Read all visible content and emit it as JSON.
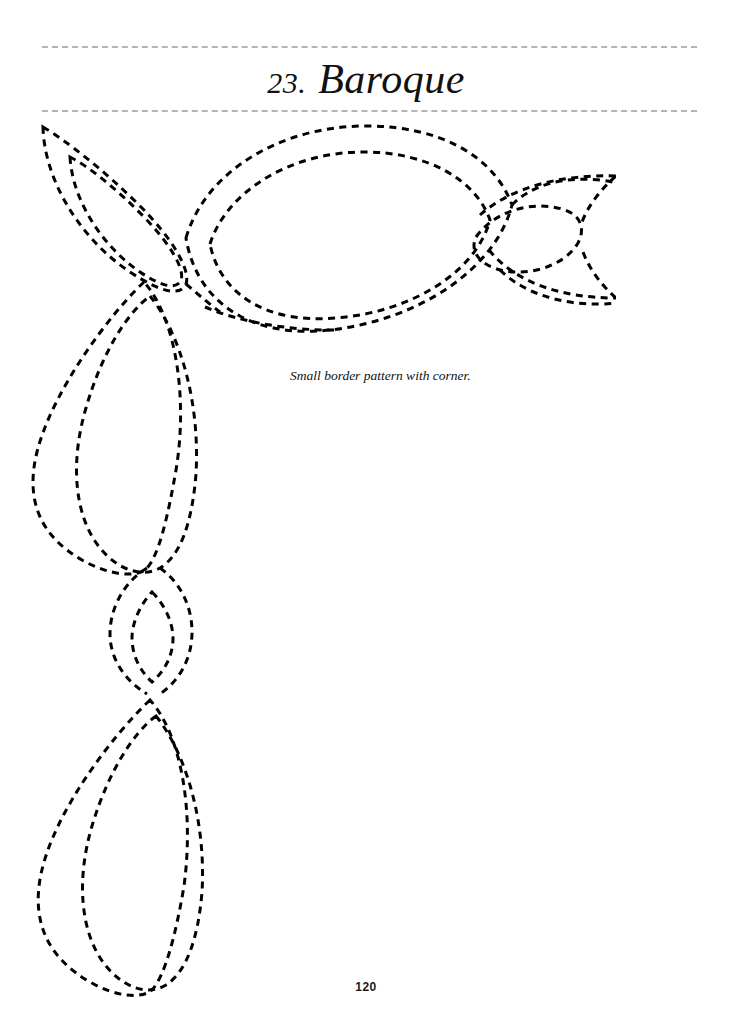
{
  "page": {
    "background_color": "#ffffff",
    "number": "120",
    "width": 732,
    "height": 1027
  },
  "header": {
    "number": "23.",
    "title": "Baroque",
    "rule_color": "#b4b4b4",
    "rule_style": "dashed"
  },
  "caption": {
    "text": "Small border pattern with corner."
  },
  "artwork": {
    "name": "baroque-border-pattern",
    "description": "Dashed quilting stitch pattern of interlocking pointed leaf and oval shapes forming a border with a corner motif",
    "stroke_color": "#000000",
    "stroke_style": "dashed",
    "stroke_width": 3,
    "dash_length": 7,
    "dash_gap": 5.5,
    "shapes": [
      {
        "name": "corner-leaf-upper-left-outer",
        "type": "leaf"
      },
      {
        "name": "corner-leaf-upper-left-inner",
        "type": "leaf"
      },
      {
        "name": "top-horizontal-oval-outer",
        "type": "oval"
      },
      {
        "name": "top-horizontal-oval-inner",
        "type": "oval"
      },
      {
        "name": "right-small-oval",
        "type": "oval"
      },
      {
        "name": "right-leaf-clipped",
        "type": "leaf"
      },
      {
        "name": "left-vertical-leaf-upper-outer",
        "type": "leaf"
      },
      {
        "name": "left-vertical-leaf-upper-inner",
        "type": "leaf"
      },
      {
        "name": "middle-small-vertical-oval",
        "type": "oval"
      },
      {
        "name": "middle-pinch-leaf",
        "type": "leaf"
      },
      {
        "name": "left-vertical-leaf-lower-outer",
        "type": "leaf"
      },
      {
        "name": "left-vertical-leaf-lower-inner",
        "type": "leaf"
      }
    ]
  }
}
